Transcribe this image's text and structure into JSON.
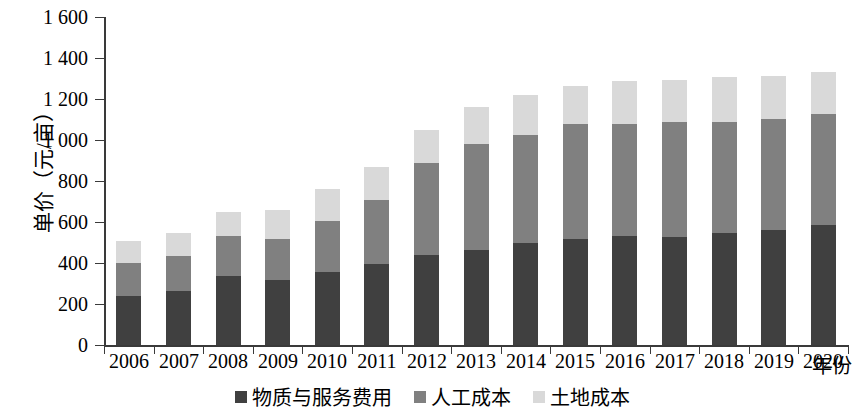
{
  "chart_data": {
    "type": "bar",
    "stacked": true,
    "title": "",
    "xlabel": "年份",
    "ylabel": "单价（元/亩）",
    "ylim": [
      0,
      1600
    ],
    "ytick_step": 200,
    "ytick_labels": [
      "1 600",
      "1 400",
      "1 200",
      "1 000",
      "800",
      "600",
      "400",
      "200",
      "0"
    ],
    "ytick_values": [
      1600,
      1400,
      1200,
      1000,
      800,
      600,
      400,
      200,
      0
    ],
    "grid": false,
    "legend_position": "bottom-center",
    "categories": [
      "2006",
      "2007",
      "2008",
      "2009",
      "2010",
      "2011",
      "2012",
      "2013",
      "2014",
      "2015",
      "2016",
      "2017",
      "2018",
      "2019",
      "2020"
    ],
    "series": [
      {
        "name": "物质与服务费用",
        "color": "#404040",
        "values": [
          239,
          263,
          337,
          317,
          356,
          395,
          439,
          463,
          498,
          517,
          532,
          527,
          546,
          561,
          586
        ]
      },
      {
        "name": "人工成本",
        "color": "#808080",
        "values": [
          161,
          171,
          195,
          200,
          249,
          312,
          449,
          517,
          527,
          561,
          546,
          561,
          541,
          541,
          541
        ]
      },
      {
        "name": "土地成本",
        "color": "#d9d9d9",
        "values": [
          107,
          112,
          117,
          141,
          156,
          161,
          161,
          180,
          195,
          185,
          210,
          205,
          219,
          210,
          205
        ]
      }
    ],
    "totals": [
      507,
      546,
      649,
      658,
      761,
      868,
      1049,
      1160,
      1220,
      1263,
      1288,
      1293,
      1306,
      1312,
      1332
    ]
  },
  "legend": {
    "items": [
      {
        "label": "物质与服务费用",
        "color": "#404040"
      },
      {
        "label": "人工成本",
        "color": "#808080"
      },
      {
        "label": "土地成本",
        "color": "#d9d9d9"
      }
    ]
  }
}
